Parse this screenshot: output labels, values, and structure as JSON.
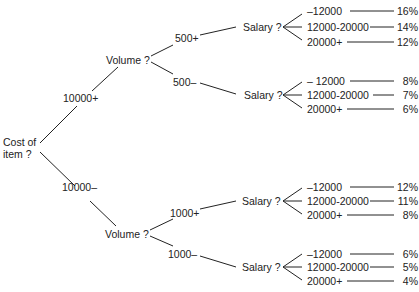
{
  "root": {
    "label_line1": "Cost of",
    "label_line2": "item ?"
  },
  "branches": [
    {
      "edge_label": "10000+",
      "node": "Volume ?",
      "children": [
        {
          "edge_label": "500+",
          "node": "Salary ?",
          "leaves": [
            {
              "range": "–12000",
              "value": "16%"
            },
            {
              "range": "12000-20000",
              "value": "14%"
            },
            {
              "range": "20000+",
              "value": "12%"
            }
          ]
        },
        {
          "edge_label": "500–",
          "node": "Salary ?",
          "leaves": [
            {
              "range": "– 12000",
              "value": "8%"
            },
            {
              "range": "12000-20000",
              "value": "7%"
            },
            {
              "range": "20000+",
              "value": "6%"
            }
          ]
        }
      ]
    },
    {
      "edge_label": "10000–",
      "node": "Volume ?",
      "children": [
        {
          "edge_label": "1000+",
          "node": "Salary ?",
          "leaves": [
            {
              "range": "–12000",
              "value": "12%"
            },
            {
              "range": "12000-20000",
              "value": "11%"
            },
            {
              "range": "20000+",
              "value": "8%"
            }
          ]
        },
        {
          "edge_label": "1000–",
          "node": "Salary ?",
          "leaves": [
            {
              "range": "–12000",
              "value": "6%"
            },
            {
              "range": "12000-20000",
              "value": "5%"
            },
            {
              "range": "20000+",
              "value": "4%"
            }
          ]
        }
      ]
    }
  ]
}
